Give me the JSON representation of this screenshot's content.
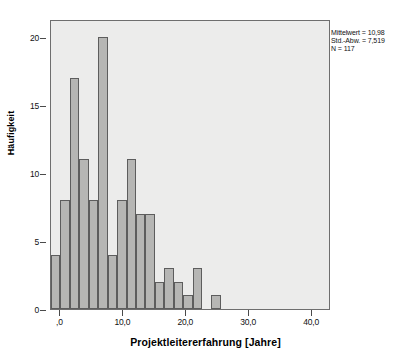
{
  "chart_data": {
    "type": "bar",
    "title": "",
    "subtitle": "",
    "xlabel": "Projektleitererfahrung [Jahre]",
    "ylabel": "Häufigkeit",
    "xlim": [
      -1.5,
      43.0
    ],
    "ylim": [
      0,
      21.3
    ],
    "grid": false,
    "legend": null,
    "bin_width": 1.5,
    "x_tick_labels": [
      ",0",
      "10,0",
      "20,0",
      "30,0",
      "40,0"
    ],
    "x_tick_values": [
      0,
      10,
      20,
      30,
      40
    ],
    "y_tick_labels": [
      "0",
      "5",
      "10",
      "15",
      "20"
    ],
    "y_tick_values": [
      0,
      5,
      10,
      15,
      20
    ],
    "bins": [
      {
        "x0": -1.5,
        "x1": 0.0,
        "value": 4
      },
      {
        "x0": 0.0,
        "x1": 1.5,
        "value": 8
      },
      {
        "x0": 1.5,
        "x1": 3.0,
        "value": 17
      },
      {
        "x0": 3.0,
        "x1": 4.5,
        "value": 11
      },
      {
        "x0": 4.5,
        "x1": 6.0,
        "value": 8
      },
      {
        "x0": 6.0,
        "x1": 7.5,
        "value": 20
      },
      {
        "x0": 7.5,
        "x1": 9.0,
        "value": 4
      },
      {
        "x0": 9.0,
        "x1": 10.5,
        "value": 8
      },
      {
        "x0": 10.5,
        "x1": 12.0,
        "value": 11
      },
      {
        "x0": 12.0,
        "x1": 13.5,
        "value": 7
      },
      {
        "x0": 13.5,
        "x1": 15.0,
        "value": 7
      },
      {
        "x0": 15.0,
        "x1": 16.5,
        "value": 2
      },
      {
        "x0": 16.5,
        "x1": 18.0,
        "value": 3
      },
      {
        "x0": 18.0,
        "x1": 19.5,
        "value": 2
      },
      {
        "x0": 19.5,
        "x1": 21.0,
        "value": 1
      },
      {
        "x0": 21.0,
        "x1": 22.5,
        "value": 3
      },
      {
        "x0": 22.5,
        "x1": 24.0,
        "value": 0
      },
      {
        "x0": 24.0,
        "x1": 25.5,
        "value": 1
      }
    ],
    "categories": [
      "-1,5",
      "0,0",
      "1,5",
      "3,0",
      "4,5",
      "6,0",
      "7,5",
      "9,0",
      "10,5",
      "12,0",
      "13,5",
      "15,0",
      "16,5",
      "18,0",
      "19,5",
      "21,0",
      "22,5",
      "24,0"
    ],
    "values": [
      4,
      8,
      17,
      11,
      8,
      20,
      4,
      8,
      11,
      7,
      7,
      2,
      3,
      2,
      1,
      3,
      0,
      1
    ],
    "annotations": {
      "mean_label": "Mittelwert = 10,98",
      "std_label": "Std.-Abw. = 7,519",
      "n_label": "N = 117",
      "mean": 10.98,
      "std": 7.519,
      "n": 117,
      "position": "top-right-outside"
    },
    "colors": {
      "bar_fill": "#b6b6b4",
      "bar_border": "#5d5d5d",
      "plot_background": "#ececeb",
      "frame": "#6e6e6e",
      "text": "#111111"
    }
  }
}
